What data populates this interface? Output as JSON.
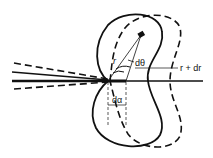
{
  "figure": {
    "type": "polar-pattern-diagram",
    "curves": [
      {
        "name": "pattern-r",
        "style": "solid"
      },
      {
        "name": "pattern-r-plus-dr",
        "style": "dashed"
      }
    ],
    "beams": [
      {
        "name": "incident-beam-center",
        "style": "solid-thick"
      },
      {
        "name": "incident-beam-upper",
        "style": "solid"
      },
      {
        "name": "beam-edge-upper",
        "style": "dashed"
      },
      {
        "name": "beam-edge-lower",
        "style": "dashed"
      }
    ],
    "labels": {
      "r": "r",
      "dtheta": "dθ",
      "r_plus_dr": "r + dr",
      "dalpha": "dα"
    },
    "colors": {
      "ink": "#111111",
      "background": "#ffffff"
    }
  }
}
